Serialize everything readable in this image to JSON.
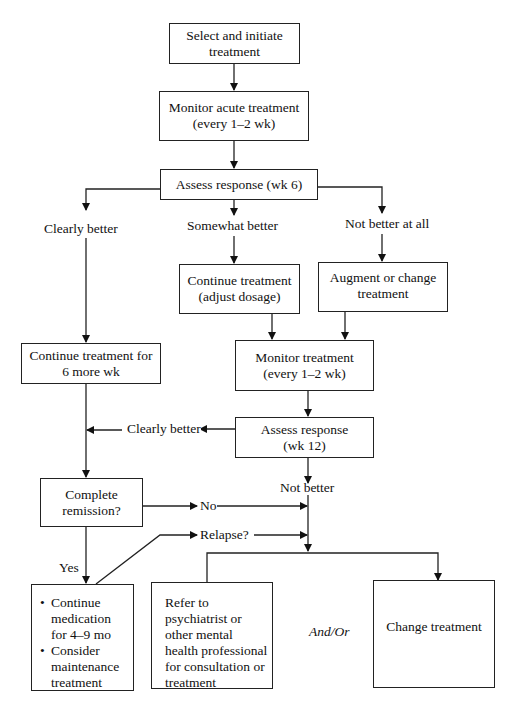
{
  "diagram": {
    "type": "flowchart",
    "nodes": {
      "select": {
        "text": "Select and initiate treatment"
      },
      "monitor_acute": {
        "line1": "Monitor acute treatment",
        "line2": "(every 1–2 wk)"
      },
      "assess6": {
        "text": "Assess response (wk 6)"
      },
      "continue_adjust": {
        "line1": "Continue treatment",
        "line2": "(adjust dosage)"
      },
      "augment": {
        "line1": "Augment or change",
        "line2": "treatment"
      },
      "continue6": {
        "line1": "Continue treatment for",
        "line2": "6 more wk"
      },
      "monitor": {
        "line1": "Monitor treatment",
        "line2": "(every 1–2 wk)"
      },
      "assess12": {
        "line1": "Assess response",
        "line2": "(wk 12)"
      },
      "remission": {
        "line1": "Complete",
        "line2": "remission?"
      },
      "continue_med": {
        "bullets": [
          "Continue medication for 4–9 mo",
          "Consider maintenance treatment"
        ]
      },
      "refer": {
        "text": "Refer to psychiatrist or other mental health professional for consultation or treatment"
      },
      "change": {
        "text": "Change treatment"
      }
    },
    "labels": {
      "clearly_better": "Clearly better",
      "somewhat_better": "Somewhat better",
      "not_better_at_all": "Not better at all",
      "clearly_better_2": "Clearly better",
      "not_better": "Not better",
      "no": "No",
      "relapse": "Relapse?",
      "yes": "Yes",
      "and_or": "And/Or"
    }
  }
}
